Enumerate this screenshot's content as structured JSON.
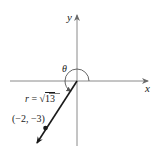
{
  "diagram": {
    "axes": {
      "x_label": "x",
      "y_label": "y"
    },
    "angle_label": "θ",
    "radius_label": "r = √13",
    "radius_prefix": "r",
    "radius_eq": " = ",
    "radius_sqrt": "√",
    "radius_value": "13",
    "point_label": "(−2, −3)",
    "point": {
      "x": -2,
      "y": -3
    },
    "colors": {
      "axis": "#8a8a8a",
      "ray": "#1a1a1a",
      "arc": "#555555",
      "text": "#1a1a1a"
    }
  }
}
